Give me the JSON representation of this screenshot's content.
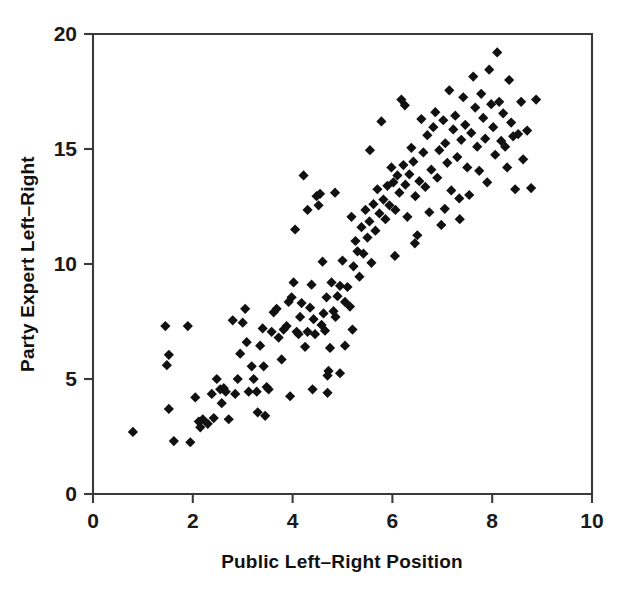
{
  "chart_data": {
    "type": "scatter",
    "title": "",
    "xlabel": "Public Left–Right Position",
    "ylabel": "Party Expert Left–Right",
    "xlim": [
      0,
      10
    ],
    "ylim": [
      0,
      20
    ],
    "xticks": [
      0,
      2,
      4,
      6,
      8,
      10
    ],
    "yticks": [
      0,
      5,
      10,
      15,
      20
    ],
    "xtick_labels": [
      "0",
      "2",
      "4",
      "6",
      "8",
      "10"
    ],
    "ytick_labels": [
      "0",
      "5",
      "10",
      "15",
      "20"
    ],
    "grid": false,
    "legend": false,
    "marker": "diamond",
    "marker_color": "#111111",
    "marker_size": 9,
    "n_points": 186,
    "points": [
      [
        0.8,
        2.7
      ],
      [
        1.45,
        7.3
      ],
      [
        1.52,
        6.05
      ],
      [
        1.9,
        7.3
      ],
      [
        1.48,
        5.6
      ],
      [
        1.52,
        3.7
      ],
      [
        1.62,
        2.3
      ],
      [
        1.95,
        2.25
      ],
      [
        2.05,
        4.2
      ],
      [
        2.12,
        3.15
      ],
      [
        2.2,
        3.25
      ],
      [
        2.3,
        3.05
      ],
      [
        2.38,
        4.35
      ],
      [
        2.42,
        3.3
      ],
      [
        2.48,
        5.0
      ],
      [
        2.55,
        4.55
      ],
      [
        2.58,
        3.95
      ],
      [
        2.62,
        4.6
      ],
      [
        2.66,
        4.45
      ],
      [
        2.72,
        3.25
      ],
      [
        2.8,
        7.55
      ],
      [
        2.85,
        4.35
      ],
      [
        2.9,
        5.0
      ],
      [
        2.95,
        6.1
      ],
      [
        3.0,
        7.45
      ],
      [
        3.05,
        8.05
      ],
      [
        3.08,
        6.6
      ],
      [
        3.12,
        4.45
      ],
      [
        3.18,
        5.55
      ],
      [
        3.22,
        5.0
      ],
      [
        3.28,
        4.45
      ],
      [
        3.35,
        6.45
      ],
      [
        3.4,
        7.2
      ],
      [
        3.42,
        5.55
      ],
      [
        3.48,
        4.65
      ],
      [
        3.52,
        4.55
      ],
      [
        3.58,
        7.05
      ],
      [
        3.62,
        7.9
      ],
      [
        3.68,
        8.05
      ],
      [
        3.72,
        6.8
      ],
      [
        3.78,
        5.85
      ],
      [
        3.82,
        7.15
      ],
      [
        3.88,
        7.3
      ],
      [
        3.92,
        8.35
      ],
      [
        3.98,
        8.55
      ],
      [
        4.02,
        9.2
      ],
      [
        4.05,
        11.5
      ],
      [
        4.08,
        7.05
      ],
      [
        4.12,
        6.95
      ],
      [
        4.15,
        7.7
      ],
      [
        4.18,
        8.3
      ],
      [
        4.22,
        13.85
      ],
      [
        4.25,
        6.4
      ],
      [
        4.3,
        7.05
      ],
      [
        4.35,
        8.1
      ],
      [
        4.38,
        9.1
      ],
      [
        4.42,
        7.6
      ],
      [
        4.45,
        6.95
      ],
      [
        4.48,
        12.95
      ],
      [
        4.52,
        12.55
      ],
      [
        4.55,
        13.05
      ],
      [
        4.58,
        7.35
      ],
      [
        4.62,
        7.85
      ],
      [
        4.65,
        7.1
      ],
      [
        4.68,
        8.55
      ],
      [
        4.7,
        5.15
      ],
      [
        4.72,
        5.35
      ],
      [
        4.75,
        6.35
      ],
      [
        4.78,
        9.2
      ],
      [
        4.82,
        7.95
      ],
      [
        4.86,
        7.7
      ],
      [
        4.9,
        8.6
      ],
      [
        4.95,
        9.05
      ],
      [
        5.0,
        10.15
      ],
      [
        5.05,
        8.35
      ],
      [
        5.1,
        9.0
      ],
      [
        5.15,
        8.15
      ],
      [
        5.18,
        12.05
      ],
      [
        5.22,
        9.9
      ],
      [
        5.26,
        11.0
      ],
      [
        5.3,
        10.55
      ],
      [
        5.34,
        9.45
      ],
      [
        5.38,
        11.6
      ],
      [
        5.42,
        10.45
      ],
      [
        5.46,
        12.35
      ],
      [
        5.5,
        11.15
      ],
      [
        5.54,
        11.85
      ],
      [
        5.58,
        10.05
      ],
      [
        5.62,
        12.6
      ],
      [
        5.66,
        11.45
      ],
      [
        5.7,
        13.25
      ],
      [
        5.74,
        12.2
      ],
      [
        5.78,
        16.2
      ],
      [
        5.82,
        12.8
      ],
      [
        5.86,
        11.95
      ],
      [
        5.9,
        13.4
      ],
      [
        5.94,
        12.55
      ],
      [
        5.98,
        14.2
      ],
      [
        6.02,
        13.55
      ],
      [
        6.06,
        12.35
      ],
      [
        6.1,
        13.85
      ],
      [
        6.14,
        13.1
      ],
      [
        6.18,
        17.15
      ],
      [
        6.22,
        14.3
      ],
      [
        6.26,
        13.45
      ],
      [
        6.3,
        12.05
      ],
      [
        6.34,
        13.9
      ],
      [
        6.38,
        15.05
      ],
      [
        6.42,
        14.45
      ],
      [
        6.46,
        12.95
      ],
      [
        6.5,
        11.25
      ],
      [
        6.54,
        13.6
      ],
      [
        6.58,
        16.3
      ],
      [
        6.62,
        14.85
      ],
      [
        6.66,
        13.35
      ],
      [
        6.7,
        15.6
      ],
      [
        6.74,
        12.25
      ],
      [
        6.78,
        14.1
      ],
      [
        6.82,
        15.95
      ],
      [
        6.86,
        16.6
      ],
      [
        6.9,
        13.75
      ],
      [
        6.94,
        14.95
      ],
      [
        6.98,
        11.7
      ],
      [
        7.02,
        16.25
      ],
      [
        7.06,
        15.25
      ],
      [
        7.1,
        14.4
      ],
      [
        7.14,
        17.55
      ],
      [
        7.18,
        13.2
      ],
      [
        7.22,
        15.85
      ],
      [
        7.26,
        16.45
      ],
      [
        7.3,
        14.65
      ],
      [
        7.34,
        12.85
      ],
      [
        7.38,
        15.4
      ],
      [
        7.42,
        17.25
      ],
      [
        7.46,
        16.05
      ],
      [
        7.5,
        14.2
      ],
      [
        7.54,
        13.0
      ],
      [
        7.58,
        15.7
      ],
      [
        7.62,
        18.15
      ],
      [
        7.66,
        16.8
      ],
      [
        7.7,
        15.1
      ],
      [
        7.74,
        14.05
      ],
      [
        7.78,
        17.4
      ],
      [
        7.82,
        16.35
      ],
      [
        7.86,
        15.45
      ],
      [
        7.9,
        13.55
      ],
      [
        7.94,
        18.45
      ],
      [
        7.98,
        16.95
      ],
      [
        8.02,
        15.95
      ],
      [
        8.06,
        14.75
      ],
      [
        8.1,
        19.2
      ],
      [
        8.14,
        17.05
      ],
      [
        8.18,
        15.35
      ],
      [
        8.22,
        16.55
      ],
      [
        8.26,
        15.1
      ],
      [
        8.3,
        14.2
      ],
      [
        8.34,
        18.0
      ],
      [
        8.38,
        16.15
      ],
      [
        8.42,
        15.55
      ],
      [
        8.46,
        13.25
      ],
      [
        8.52,
        15.65
      ],
      [
        8.58,
        17.05
      ],
      [
        8.62,
        14.55
      ],
      [
        8.7,
        15.8
      ],
      [
        8.78,
        13.3
      ],
      [
        8.88,
        17.15
      ],
      [
        4.6,
        10.1
      ],
      [
        5.2,
        7.15
      ],
      [
        5.05,
        6.45
      ],
      [
        4.95,
        5.25
      ],
      [
        3.3,
        3.55
      ],
      [
        3.45,
        3.4
      ],
      [
        2.15,
        2.9
      ],
      [
        3.95,
        4.25
      ],
      [
        4.4,
        4.55
      ],
      [
        4.7,
        4.4
      ],
      [
        6.05,
        10.35
      ],
      [
        6.45,
        10.9
      ],
      [
        7.05,
        12.4
      ],
      [
        7.35,
        11.95
      ],
      [
        6.25,
        16.9
      ],
      [
        5.55,
        14.95
      ],
      [
        4.85,
        13.1
      ],
      [
        4.3,
        12.35
      ]
    ]
  },
  "axes": {
    "x_title": "Public Left–Right Position",
    "y_title": "Party Expert Left–Right"
  }
}
